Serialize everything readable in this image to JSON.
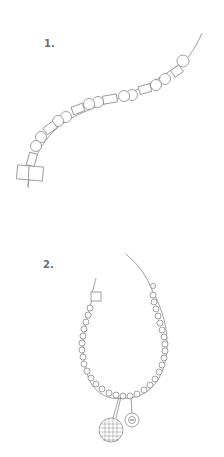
{
  "steps": [
    {
      "label": "1.",
      "description": "Strand of round and tube beads on wire with square end bead"
    },
    {
      "label": "2.",
      "description": "Completed beaded necklace with clasp, round mesh pendant and small button charm"
    }
  ],
  "colors": {
    "line": "#7a7a7a",
    "text": "#6e6e6e",
    "background": "#ffffff"
  }
}
